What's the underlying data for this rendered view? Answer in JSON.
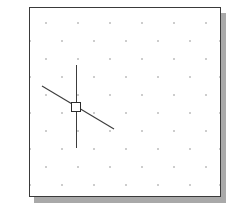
{
  "app": {
    "title": "Drawing Canvas",
    "background_color": "#ffffff"
  },
  "drawing_frame": {
    "name": "drawing-sheet",
    "border_color": "#3a3a3a",
    "fill_color": "#ffffff",
    "shadow_color": "#a9a9a9",
    "x": 29,
    "y": 7,
    "width": 192,
    "height": 190
  },
  "grid": {
    "name": "snap-grid",
    "style": "staggered-dots",
    "dot_color": "#9a9a9a",
    "dot_size": 1.4,
    "spacing_x": 32,
    "spacing_y": 18,
    "row_offset_x": 16,
    "dots": [
      {
        "x": 16,
        "y": 15
      },
      {
        "x": 48,
        "y": 15
      },
      {
        "x": 80,
        "y": 15
      },
      {
        "x": 112,
        "y": 15
      },
      {
        "x": 144,
        "y": 15
      },
      {
        "x": 176,
        "y": 15
      },
      {
        "x": 0,
        "y": 33
      },
      {
        "x": 32,
        "y": 33
      },
      {
        "x": 64,
        "y": 33
      },
      {
        "x": 96,
        "y": 33
      },
      {
        "x": 128,
        "y": 33
      },
      {
        "x": 160,
        "y": 33
      },
      {
        "x": 190,
        "y": 33
      },
      {
        "x": 16,
        "y": 51
      },
      {
        "x": 48,
        "y": 51
      },
      {
        "x": 80,
        "y": 51
      },
      {
        "x": 112,
        "y": 51
      },
      {
        "x": 144,
        "y": 51
      },
      {
        "x": 176,
        "y": 51
      },
      {
        "x": 0,
        "y": 69
      },
      {
        "x": 32,
        "y": 69
      },
      {
        "x": 64,
        "y": 69
      },
      {
        "x": 96,
        "y": 69
      },
      {
        "x": 128,
        "y": 69
      },
      {
        "x": 160,
        "y": 69
      },
      {
        "x": 190,
        "y": 69
      },
      {
        "x": 16,
        "y": 87
      },
      {
        "x": 48,
        "y": 87
      },
      {
        "x": 80,
        "y": 87
      },
      {
        "x": 112,
        "y": 87
      },
      {
        "x": 144,
        "y": 87
      },
      {
        "x": 176,
        "y": 87
      },
      {
        "x": 0,
        "y": 105
      },
      {
        "x": 32,
        "y": 105
      },
      {
        "x": 64,
        "y": 105
      },
      {
        "x": 96,
        "y": 105
      },
      {
        "x": 128,
        "y": 105
      },
      {
        "x": 160,
        "y": 105
      },
      {
        "x": 190,
        "y": 105
      },
      {
        "x": 16,
        "y": 123
      },
      {
        "x": 48,
        "y": 123
      },
      {
        "x": 80,
        "y": 123
      },
      {
        "x": 112,
        "y": 123
      },
      {
        "x": 144,
        "y": 123
      },
      {
        "x": 176,
        "y": 123
      },
      {
        "x": 0,
        "y": 141
      },
      {
        "x": 32,
        "y": 141
      },
      {
        "x": 64,
        "y": 141
      },
      {
        "x": 96,
        "y": 141
      },
      {
        "x": 128,
        "y": 141
      },
      {
        "x": 160,
        "y": 141
      },
      {
        "x": 190,
        "y": 141
      },
      {
        "x": 16,
        "y": 159
      },
      {
        "x": 48,
        "y": 159
      },
      {
        "x": 80,
        "y": 159
      },
      {
        "x": 112,
        "y": 159
      },
      {
        "x": 144,
        "y": 159
      },
      {
        "x": 176,
        "y": 159
      },
      {
        "x": 0,
        "y": 177
      },
      {
        "x": 32,
        "y": 177
      },
      {
        "x": 64,
        "y": 177
      },
      {
        "x": 96,
        "y": 177
      },
      {
        "x": 128,
        "y": 177
      },
      {
        "x": 160,
        "y": 177
      },
      {
        "x": 190,
        "y": 177
      }
    ]
  },
  "geometry": {
    "vertical_line": {
      "name": "vertical-construction-line",
      "color": "#3c3c3c",
      "x1": 46,
      "y1": 57,
      "x2": 46,
      "y2": 140
    },
    "diagonal_line": {
      "name": "diagonal-construction-line",
      "color": "#3c3c3c",
      "x1": 12,
      "y1": 78,
      "x2": 84,
      "y2": 121
    },
    "grip": {
      "name": "selection-grip",
      "fill": "#ffffff",
      "stroke": "#2b2b2b",
      "cx": 46,
      "cy": 99,
      "size": 9
    }
  }
}
